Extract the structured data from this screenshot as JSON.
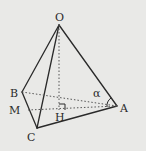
{
  "diagram": {
    "type": "tetrahedron",
    "background": "#e9e9e7",
    "line_color": "#2a2a2a",
    "points": {
      "O": {
        "label": "O",
        "x": 59,
        "y": 25
      },
      "A": {
        "label": "A",
        "x": 117,
        "y": 106
      },
      "B": {
        "label": "B",
        "x": 22,
        "y": 92
      },
      "C": {
        "label": "C",
        "x": 37,
        "y": 128
      },
      "H": {
        "label": "H",
        "x": 59,
        "y": 110
      },
      "M": {
        "label": "M",
        "x": 28,
        "y": 110
      }
    },
    "angle_label": "α",
    "solid_edges": [
      "OA",
      "OB",
      "OC",
      "BC",
      "CA"
    ],
    "dashed_edges": [
      "BA",
      "OH",
      "MA"
    ],
    "right_angle_at": "H"
  }
}
